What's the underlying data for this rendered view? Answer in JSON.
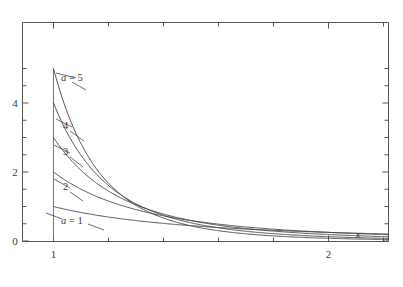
{
  "chart_data": {
    "type": "line",
    "title": "",
    "subtitle": "",
    "xlabel": "x",
    "ylabel": "",
    "xlim": [
      0.88,
      2.22
    ],
    "ylim": [
      -0.12,
      5.55
    ],
    "grid": false,
    "legend_position": "inline-annotations",
    "x_ticks_major": [
      1,
      2
    ],
    "x_tick_labels_major": [
      "1",
      "2"
    ],
    "x_ticks_minor": [
      1.2,
      1.4,
      1.6,
      1.8,
      2.2
    ],
    "y_ticks_major": [
      0,
      2,
      4
    ],
    "y_tick_labels_major": [
      "0",
      "2",
      "4"
    ],
    "y_ticks_minor": [
      0.5,
      1,
      1.5,
      2.5,
      3,
      3.5,
      4.5,
      5
    ],
    "x": [
      1.0,
      1.02,
      1.04,
      1.06,
      1.08,
      1.1,
      1.125,
      1.15,
      1.175,
      1.2,
      1.25,
      1.3,
      1.35,
      1.4,
      1.45,
      1.5,
      1.55,
      1.6,
      1.65,
      1.7,
      1.75,
      1.8,
      1.85,
      1.9,
      1.95,
      2.0,
      2.05,
      2.1,
      2.15,
      2.2
    ],
    "series": [
      {
        "name": "a = 1",
        "label": "a = 1",
        "a": 1,
        "color": "#3f3f42",
        "start_value": 1.0,
        "values": [
          1.0,
          0.961,
          0.925,
          0.89,
          0.857,
          0.826,
          0.79,
          0.756,
          0.724,
          0.694,
          0.64,
          0.592,
          0.549,
          0.51,
          0.476,
          0.444,
          0.416,
          0.391,
          0.367,
          0.346,
          0.327,
          0.309,
          0.292,
          0.277,
          0.263,
          0.25,
          0.238,
          0.227,
          0.216,
          0.207
        ]
      },
      {
        "name": "a = 2",
        "label": "2",
        "a": 2,
        "color": "#3f3f42",
        "start_value": 2.0,
        "values": [
          2.0,
          1.884,
          1.778,
          1.679,
          1.588,
          1.503,
          1.405,
          1.315,
          1.233,
          1.157,
          1.024,
          0.911,
          0.813,
          0.729,
          0.656,
          0.593,
          0.537,
          0.488,
          0.445,
          0.407,
          0.373,
          0.343,
          0.316,
          0.291,
          0.27,
          0.25,
          0.232,
          0.216,
          0.201,
          0.188
        ]
      },
      {
        "name": "a = 3",
        "label": "3",
        "a": 3,
        "color": "#3f3f42",
        "start_value": 3.0,
        "values": [
          3.0,
          2.77,
          2.563,
          2.375,
          2.205,
          2.05,
          1.873,
          1.715,
          1.574,
          1.447,
          1.229,
          1.051,
          0.903,
          0.781,
          0.679,
          0.593,
          0.52,
          0.458,
          0.405,
          0.359,
          0.32,
          0.286,
          0.256,
          0.23,
          0.208,
          0.188,
          0.17,
          0.154,
          0.14,
          0.128
        ]
      },
      {
        "name": "a = 4",
        "label": "4",
        "a": 4,
        "color": "#3f3f42",
        "start_value": 4.0,
        "values": [
          4.0,
          3.62,
          3.284,
          2.984,
          2.717,
          2.479,
          2.216,
          1.987,
          1.786,
          1.608,
          1.311,
          1.078,
          0.892,
          0.744,
          0.624,
          0.527,
          0.447,
          0.381,
          0.327,
          0.282,
          0.244,
          0.212,
          0.185,
          0.162,
          0.142,
          0.125,
          0.11,
          0.098,
          0.087,
          0.078
        ]
      },
      {
        "name": "a = 5",
        "label": "a = 5",
        "a": 5,
        "color": "#3f3f42",
        "start_value": 5.0,
        "values": [
          5.0,
          4.435,
          3.943,
          3.514,
          3.14,
          2.812,
          2.458,
          2.158,
          1.901,
          1.674,
          1.311,
          1.037,
          0.826,
          0.665,
          0.538,
          0.439,
          0.361,
          0.298,
          0.248,
          0.207,
          0.174,
          0.147,
          0.125,
          0.106,
          0.09,
          0.078,
          0.067,
          0.058,
          0.05,
          0.043
        ]
      }
    ],
    "annotations": [
      {
        "text": "a = 5",
        "for_series": "a = 5",
        "x_px": 61,
        "y_px": 81
      },
      {
        "text": "4",
        "for_series": "a = 4",
        "x_px": 63,
        "y_px": 129
      },
      {
        "text": "3",
        "for_series": "a = 3",
        "x_px": 63,
        "y_px": 155
      },
      {
        "text": "2",
        "for_series": "a = 2",
        "x_px": 63,
        "y_px": 190
      },
      {
        "text": "a = 1",
        "for_series": "a = 1",
        "x_px": 61,
        "y_px": 221
      }
    ]
  },
  "axes": {
    "x_label": "x",
    "x_tick_1": "1",
    "x_tick_2": "2",
    "y_tick_0": "0",
    "y_tick_2": "2",
    "y_tick_4": "4"
  },
  "labels": {
    "a5": "a = 5",
    "a4": "4",
    "a3": "3",
    "a2": "2",
    "a1": "a = 1",
    "a5_var": "a",
    "a5_rest": " = 5",
    "a1_var": "a",
    "a1_rest": " = 1"
  },
  "colors": {
    "background": "#ffffff",
    "curve": "#3f3f42",
    "frame": "#555558",
    "text": "#3a3a3c"
  }
}
